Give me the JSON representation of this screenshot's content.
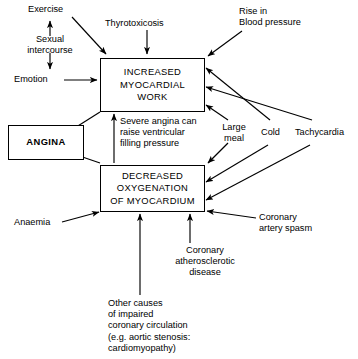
{
  "diagram": {
    "line_color": "#000000",
    "background": "#ffffff",
    "boxes": {
      "increased_myocardial_work": "INCREASED\nMYOCARDIAL\nWORK",
      "decreased_oxygenation": "DECREASED\nOXYGENATION\nOF MYOCARDIUM",
      "angina": "ANGINA"
    },
    "labels": {
      "exercise": "Exercise",
      "sexual_intercourse": "Sexual\nintercourse",
      "emotion": "Emotion",
      "thyrotoxicosis": "Thyrotoxicosis",
      "rise_in_blood_pressure": "Rise in\nBlood pressure",
      "severe_angina_note": "Severe angina can\nraise ventricular\nfilling pressure",
      "large_meal": "Large\nmeal",
      "cold": "Cold",
      "tachycardia": "Tachycardia",
      "anaemia": "Anaemia",
      "coronary_artery_spasm": "Coronary\nartery spasm",
      "coronary_atherosclerotic_disease": "Coronary\natherosclerotic\ndisease",
      "other_causes": "Other causes\nof impaired\ncoronary circulation\n(e.g. aortic stenosis:\n    cardiomyopathy)"
    }
  }
}
